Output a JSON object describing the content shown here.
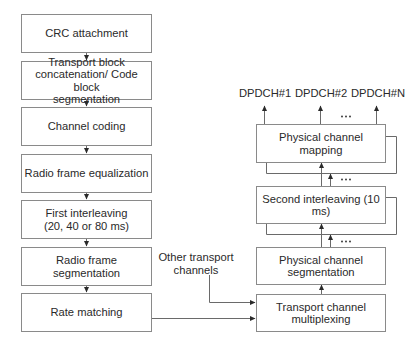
{
  "diagram": {
    "type": "flowchart",
    "left_column": {
      "blocks": [
        {
          "id": "crc",
          "label": "CRC attachment"
        },
        {
          "id": "tb-concat",
          "label": "Transport block\nconcatenation/ Code block\nsegmentation"
        },
        {
          "id": "channel-coding",
          "label": "Channel coding"
        },
        {
          "id": "radio-eq",
          "label": "Radio frame equalization"
        },
        {
          "id": "first-interleaving",
          "label": "First interleaving\n(20, 40 or 80 ms)"
        },
        {
          "id": "radio-seg",
          "label": "Radio frame segmentation"
        },
        {
          "id": "rate-matching",
          "label": "Rate matching"
        }
      ]
    },
    "right_column": {
      "blocks": [
        {
          "id": "phys-mapping",
          "label": "Physical channel mapping"
        },
        {
          "id": "second-interleaving",
          "label": "Second interleaving (10 ms)"
        },
        {
          "id": "phys-seg",
          "label": "Physical channel\nsegmentation"
        },
        {
          "id": "trch-mux",
          "label": "Transport channel\nmultiplexing"
        }
      ]
    },
    "outputs": [
      {
        "label": "DPDCH#1"
      },
      {
        "label": "DPDCH#2"
      },
      {
        "label": "DPDCH#N"
      }
    ],
    "side_input": {
      "label": "Other transport\nchannels"
    },
    "ellipsis": "…",
    "edges": [
      {
        "from": "crc",
        "to": "tb-concat"
      },
      {
        "from": "tb-concat",
        "to": "channel-coding"
      },
      {
        "from": "channel-coding",
        "to": "radio-eq"
      },
      {
        "from": "radio-eq",
        "to": "first-interleaving"
      },
      {
        "from": "first-interleaving",
        "to": "radio-seg"
      },
      {
        "from": "radio-seg",
        "to": "rate-matching"
      },
      {
        "from": "rate-matching",
        "to": "trch-mux"
      },
      {
        "from": "other-transport-channels",
        "to": "trch-mux"
      },
      {
        "from": "trch-mux",
        "to": "phys-seg"
      },
      {
        "from": "phys-seg",
        "to": "second-interleaving"
      },
      {
        "from": "second-interleaving",
        "to": "phys-mapping"
      },
      {
        "from": "phys-mapping",
        "to": "DPDCH#1"
      },
      {
        "from": "phys-mapping",
        "to": "DPDCH#2"
      },
      {
        "from": "phys-mapping",
        "to": "DPDCH#N"
      }
    ]
  }
}
